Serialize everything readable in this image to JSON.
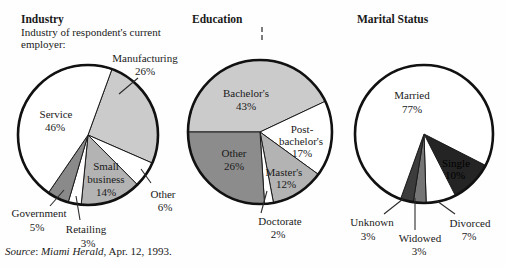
{
  "figure": {
    "kind": "three-pie-chart scanned textbook figure",
    "background": "#fefefe",
    "ink_color": "#1a1a1a"
  },
  "source_note": {
    "source_word": "Source",
    "separator": ": ",
    "journal": "Miami Herald",
    "rest": ", Apr. 12, 1993."
  },
  "chart_data": [
    {
      "type": "pie",
      "title": "Industry",
      "subtitle_lines": [
        "Industry of respondent's current",
        "employer:"
      ],
      "center_px": {
        "x": 88,
        "y": 135
      },
      "radius_px": 70,
      "start_angle_deg": 20,
      "slices": [
        {
          "label": "Manufacturing",
          "value": 26,
          "pct": "26%",
          "color": "#cbcbcb"
        },
        {
          "label": "Other",
          "value": 6,
          "pct": "6%",
          "color": "#ffffff"
        },
        {
          "label": "Small business",
          "value": 14,
          "pct": "14%",
          "color": "#b3b3b3"
        },
        {
          "label": "Retailing",
          "value": 3,
          "pct": "3%",
          "color": "#ffffff"
        },
        {
          "label": "Government",
          "value": 5,
          "pct": "5%",
          "color": "#8a8a8a"
        },
        {
          "label": "Service",
          "value": 46,
          "pct": "46%",
          "color": "#ffffff"
        }
      ]
    },
    {
      "type": "pie",
      "title": "Education",
      "center_px": {
        "x": 260,
        "y": 132
      },
      "radius_px": 72,
      "start_angle_deg": 270,
      "slices": [
        {
          "label": "Bachelor's",
          "value": 43,
          "pct": "43%",
          "color": "#cbcbcb"
        },
        {
          "label": "Post-bachelor's",
          "value": 17,
          "pct": "17%",
          "color": "#ffffff"
        },
        {
          "label": "Master's",
          "value": 12,
          "pct": "12%",
          "color": "#b3b3b3"
        },
        {
          "label": "Doctorate",
          "value": 2,
          "pct": "2%",
          "color": "#ffffff"
        },
        {
          "label": "Other",
          "value": 26,
          "pct": "26%",
          "color": "#8c8c8c"
        }
      ]
    },
    {
      "type": "pie",
      "title": "Marital Status",
      "center_px": {
        "x": 424,
        "y": 134
      },
      "radius_px": 69,
      "start_angle_deg": 117,
      "slices": [
        {
          "label": "Single",
          "value": 10,
          "pct": "10%",
          "color": "#242424"
        },
        {
          "label": "Divorced",
          "value": 7,
          "pct": "7%",
          "color": "#ffffff"
        },
        {
          "label": "Widowed",
          "value": 3,
          "pct": "3%",
          "color": "#757575"
        },
        {
          "label": "Unknown",
          "value": 3,
          "pct": "3%",
          "color": "#3c3c3c"
        },
        {
          "label": "Married",
          "value": 77,
          "pct": "77%",
          "color": "#ffffff"
        }
      ]
    }
  ],
  "annotations": {
    "text_labels": [
      {
        "text": "Manufacturing",
        "x": 145,
        "y": 52
      },
      {
        "text": "26%",
        "x": 145,
        "y": 65
      },
      {
        "text": "Service",
        "x": 56,
        "y": 108
      },
      {
        "text": "46%",
        "x": 55,
        "y": 121
      },
      {
        "text": "Small",
        "x": 106,
        "y": 160
      },
      {
        "text": "business",
        "x": 106,
        "y": 173
      },
      {
        "text": "14%",
        "x": 106,
        "y": 186
      },
      {
        "text": "Other",
        "x": 163,
        "y": 188
      },
      {
        "text": "6%",
        "x": 165,
        "y": 201
      },
      {
        "text": "Government",
        "x": 39,
        "y": 207
      },
      {
        "text": "5%",
        "x": 37,
        "y": 221
      },
      {
        "text": "Retailing",
        "x": 86,
        "y": 223
      },
      {
        "text": "3%",
        "x": 88,
        "y": 237
      },
      {
        "text": "Bachelor's",
        "x": 246,
        "y": 87
      },
      {
        "text": "43%",
        "x": 246,
        "y": 100
      },
      {
        "text": "Post-",
        "x": 302,
        "y": 123
      },
      {
        "text": "bachelor's",
        "x": 301,
        "y": 135
      },
      {
        "text": "17%",
        "x": 302,
        "y": 147
      },
      {
        "text": "Other",
        "x": 234,
        "y": 147
      },
      {
        "text": "26%",
        "x": 234,
        "y": 160
      },
      {
        "text": "Master's",
        "x": 284,
        "y": 166
      },
      {
        "text": "12%",
        "x": 286,
        "y": 178
      },
      {
        "text": "Doctorate",
        "x": 280,
        "y": 215
      },
      {
        "text": "2%",
        "x": 278,
        "y": 228
      },
      {
        "text": "Married",
        "x": 412,
        "y": 89
      },
      {
        "text": "77%",
        "x": 412,
        "y": 103
      },
      {
        "text": "Single",
        "x": 456,
        "y": 157,
        "color": "#000000"
      },
      {
        "text": "10%",
        "x": 455,
        "y": 169,
        "color": "#000000"
      },
      {
        "text": "Unknown",
        "x": 372,
        "y": 216
      },
      {
        "text": "3%",
        "x": 368,
        "y": 230
      },
      {
        "text": "Widowed",
        "x": 420,
        "y": 232
      },
      {
        "text": "3%",
        "x": 419,
        "y": 245
      },
      {
        "text": "Divorced",
        "x": 470,
        "y": 217
      },
      {
        "text": "7%",
        "x": 469,
        "y": 230
      }
    ],
    "leader_lines": [
      {
        "x1": 138,
        "y1": 78,
        "x2": 119,
        "y2": 94
      },
      {
        "x1": 151,
        "y1": 183,
        "x2": 141,
        "y2": 169
      },
      {
        "x1": 50,
        "y1": 206,
        "x2": 64,
        "y2": 190
      },
      {
        "x1": 80,
        "y1": 220,
        "x2": 76,
        "y2": 196
      },
      {
        "x1": 261,
        "y1": 213,
        "x2": 267,
        "y2": 191
      },
      {
        "x1": 384,
        "y1": 214,
        "x2": 403,
        "y2": 199
      },
      {
        "x1": 415,
        "y1": 230,
        "x2": 415,
        "y2": 198
      },
      {
        "x1": 455,
        "y1": 214,
        "x2": 437,
        "y2": 201
      }
    ],
    "artifact_dashes": [
      {
        "x1": 262,
        "y1": 27,
        "x2": 262,
        "y2": 32
      },
      {
        "x1": 262,
        "y1": 35,
        "x2": 262,
        "y2": 40
      }
    ]
  }
}
